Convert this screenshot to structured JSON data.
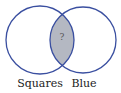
{
  "diagram": {
    "type": "venn",
    "sets": [
      {
        "label": "Squares",
        "cx": 40,
        "cy": 40,
        "r": 34
      },
      {
        "label": "Blue",
        "cx": 83,
        "cy": 40,
        "r": 33
      }
    ],
    "intersection": {
      "label": "?",
      "fill": "#b4b8c2"
    },
    "colors": {
      "outline": "#3a4fa0",
      "background": "#ffffff",
      "text": "#222222"
    }
  }
}
